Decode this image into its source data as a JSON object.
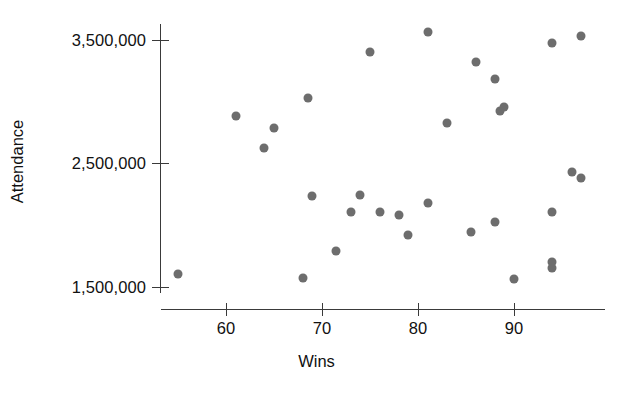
{
  "chart_data": {
    "type": "scatter",
    "title": "",
    "xlabel": "Wins",
    "ylabel": "Attendance",
    "xlim": [
      54,
      100
    ],
    "ylim": [
      1400000,
      3700000
    ],
    "grid": false,
    "legend": null,
    "marker_color": "#6d6d6d",
    "axis_color": "#3a3a3a",
    "x_ticks": [
      60,
      70,
      80,
      90
    ],
    "x_tick_labels": [
      "60",
      "70",
      "80",
      "90"
    ],
    "y_ticks": [
      1500000,
      2500000,
      3500000
    ],
    "y_tick_labels": [
      "1,500,000",
      "2,500,000",
      "3,500,000"
    ],
    "points": [
      {
        "x": 55,
        "y": 1600000
      },
      {
        "x": 61,
        "y": 2880000
      },
      {
        "x": 64,
        "y": 2620000
      },
      {
        "x": 65,
        "y": 2780000
      },
      {
        "x": 68,
        "y": 1570000
      },
      {
        "x": 68.5,
        "y": 3030000
      },
      {
        "x": 69,
        "y": 2230000
      },
      {
        "x": 71.5,
        "y": 1790000
      },
      {
        "x": 73,
        "y": 2100000
      },
      {
        "x": 74,
        "y": 2240000
      },
      {
        "x": 75,
        "y": 3400000
      },
      {
        "x": 76,
        "y": 2100000
      },
      {
        "x": 78,
        "y": 2080000
      },
      {
        "x": 79,
        "y": 1920000
      },
      {
        "x": 81,
        "y": 2180000
      },
      {
        "x": 81,
        "y": 3560000
      },
      {
        "x": 83,
        "y": 2820000
      },
      {
        "x": 85.5,
        "y": 1940000
      },
      {
        "x": 86,
        "y": 3320000
      },
      {
        "x": 88,
        "y": 3180000
      },
      {
        "x": 88,
        "y": 2020000
      },
      {
        "x": 88.5,
        "y": 2920000
      },
      {
        "x": 89,
        "y": 2950000
      },
      {
        "x": 90,
        "y": 1560000
      },
      {
        "x": 94,
        "y": 1700000
      },
      {
        "x": 94,
        "y": 1650000
      },
      {
        "x": 94,
        "y": 2100000
      },
      {
        "x": 94,
        "y": 3470000
      },
      {
        "x": 96,
        "y": 2430000
      },
      {
        "x": 97,
        "y": 3530000
      },
      {
        "x": 97,
        "y": 2380000
      }
    ]
  }
}
